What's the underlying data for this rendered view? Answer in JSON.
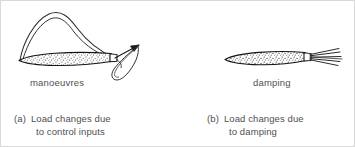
{
  "figure": {
    "panels": [
      {
        "id": "a",
        "tag": "(a)",
        "inline_label": "manoeuvres",
        "caption_line1": "Load changes due",
        "caption_line2": "to control inputs"
      },
      {
        "id": "b",
        "tag": "(b)",
        "inline_label": "damping",
        "caption_line1": "Load changes due",
        "caption_line2": "to damping"
      }
    ],
    "colors": {
      "ink": "#1a1a1a",
      "text": "#4f4f4f",
      "background": "#ffffff",
      "frame": "#d9d9d9"
    }
  }
}
